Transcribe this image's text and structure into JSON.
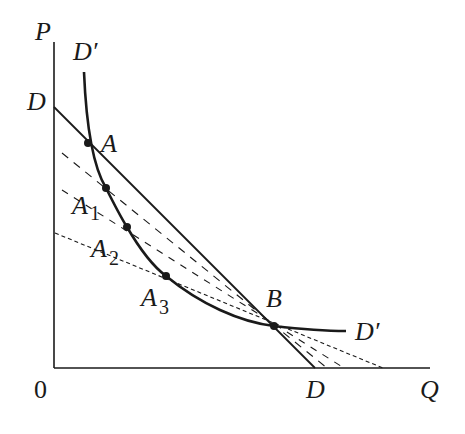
{
  "diagram": {
    "type": "economics-demand-curves",
    "colors": {
      "ink": "#1a1a1a",
      "background": "#ffffff"
    },
    "axes": {
      "y_label": "P",
      "x_label": "Q",
      "origin_label": "0"
    },
    "curves": {
      "demand_line": {
        "label_top": "D",
        "label_bottom": "D"
      },
      "curve_d_prime": {
        "label_top": "D′",
        "label_right": "D′"
      }
    },
    "points": [
      {
        "id": "A",
        "label": "A",
        "sub": ""
      },
      {
        "id": "A1",
        "label": "A",
        "sub": "1"
      },
      {
        "id": "A2",
        "label": "A",
        "sub": "2"
      },
      {
        "id": "A3",
        "label": "A",
        "sub": "3"
      },
      {
        "id": "B",
        "label": "B",
        "sub": ""
      }
    ]
  }
}
